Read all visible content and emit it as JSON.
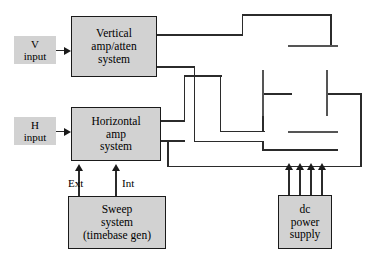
{
  "diagram": {
    "colors": {
      "box_fill": "#d2d2d2",
      "box_border": "#1a1a1a",
      "wire": "#2b2b2b",
      "plate": "#555555",
      "background": "#ffffff"
    }
  },
  "blocks": {
    "v_input": {
      "lines": [
        "V",
        "input"
      ]
    },
    "h_input": {
      "lines": [
        "H",
        "input"
      ]
    },
    "vertical_amp": {
      "lines": [
        "Vertical",
        "amp/atten",
        "system"
      ]
    },
    "horizontal_amp": {
      "lines": [
        "Horizontal",
        "amp",
        "system"
      ]
    },
    "sweep_system": {
      "lines": [
        "Sweep",
        "system",
        "(timebase gen)"
      ]
    },
    "dc_power_supply": {
      "lines": [
        "dc",
        "power",
        "supply"
      ]
    }
  },
  "labels": {
    "ext": "Ext",
    "int": "Int"
  },
  "crt": {
    "vertical_plates_count": 2,
    "horizontal_plates_count": 2,
    "power_arrows_count": 4
  }
}
